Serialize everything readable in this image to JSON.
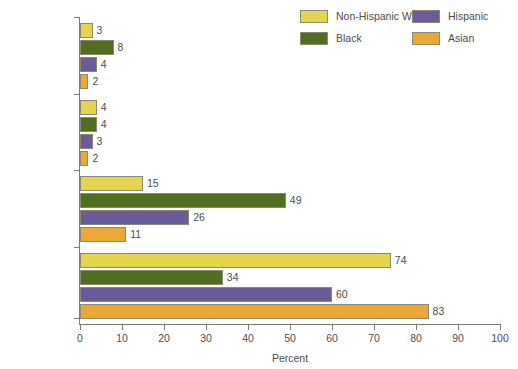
{
  "chart_data": {
    "type": "bar",
    "orientation": "horizontal",
    "title": "",
    "xlabel": "Percent",
    "ylabel": "",
    "xlim": [
      0,
      100
    ],
    "xticks": [
      0,
      10,
      20,
      30,
      40,
      50,
      60,
      70,
      80,
      90,
      100
    ],
    "xtick_labels": [
      "0",
      "10",
      "20",
      "30",
      "40",
      "50",
      "60",
      "70",
      "80",
      "90",
      "100"
    ],
    "grid": false,
    "legend_position": "top-right",
    "categories": [
      "Living with no parent",
      "Father only",
      "Mother only",
      "Living with two married parents"
    ],
    "category_lines": [
      [
        "Living with",
        "no parent"
      ],
      [
        "Father only"
      ],
      [
        "Mother only"
      ],
      [
        "Living with two",
        "married parents"
      ]
    ],
    "series": [
      {
        "name": "Non-Hispanic White",
        "color": "#e7d44e",
        "values": [
          3,
          4,
          15,
          74
        ]
      },
      {
        "name": "Black",
        "color": "#4f6e1f",
        "values": [
          8,
          4,
          49,
          34
        ]
      },
      {
        "name": "Hispanic",
        "color": "#6b5b9a",
        "values": [
          4,
          3,
          26,
          60
        ]
      },
      {
        "name": "Asian",
        "color": "#eba738",
        "values": [
          2,
          2,
          11,
          83
        ]
      }
    ]
  },
  "legend": {
    "items": [
      {
        "label": "Non-Hispanic White",
        "color": "#e7d44e"
      },
      {
        "label": "Hispanic",
        "color": "#6b5b9a"
      },
      {
        "label": "Black",
        "color": "#4f6e1f"
      },
      {
        "label": "Asian",
        "color": "#eba738"
      }
    ]
  },
  "axis": {
    "x_title": "Percent"
  }
}
